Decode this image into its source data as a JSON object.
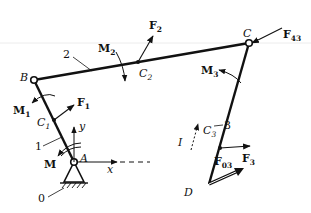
{
  "diagram": {
    "colors": {
      "line": "#111111",
      "background": "#ffffff",
      "faint_line": "#e6e6e6"
    },
    "points": {
      "A": {
        "label": "A",
        "x": 74,
        "y": 162
      },
      "B": {
        "label": "B",
        "x": 34,
        "y": 80
      },
      "C": {
        "label": "C",
        "x": 249,
        "y": 43
      },
      "D": {
        "label": "D",
        "x": 209,
        "y": 184
      },
      "C1": {
        "label": "C",
        "sub": "1",
        "x": 54,
        "y": 120
      },
      "C2": {
        "label": "C",
        "sub": "2",
        "x": 138,
        "y": 62
      },
      "C3": {
        "label": "C",
        "sub": "3",
        "x": 220,
        "y": 148
      }
    },
    "links": [
      {
        "id": "0",
        "label": "0",
        "name": "ground"
      },
      {
        "id": "1",
        "label": "1",
        "name": "crank AB"
      },
      {
        "id": "2",
        "label": "2",
        "name": "coupler BC"
      },
      {
        "id": "3",
        "label": "3",
        "name": "rocker CD"
      }
    ],
    "forces": [
      {
        "label": "F",
        "sub": "1",
        "at": "C1"
      },
      {
        "label": "F",
        "sub": "2",
        "at": "C2"
      },
      {
        "label": "F",
        "sub": "3",
        "at": "C3"
      },
      {
        "label": "F",
        "sub": "43",
        "at": "C"
      },
      {
        "label": "F",
        "sub": "03",
        "at": "D"
      }
    ],
    "moments": [
      {
        "label": "M",
        "sub": "",
        "at": "A"
      },
      {
        "label": "M",
        "sub": "1",
        "at": "link 1"
      },
      {
        "label": "M",
        "sub": "2",
        "at": "link 2"
      },
      {
        "label": "M",
        "sub": "3",
        "at": "link 3"
      }
    ],
    "axes": {
      "x_label": "x",
      "y_label": "y"
    },
    "direction_label": "I"
  }
}
